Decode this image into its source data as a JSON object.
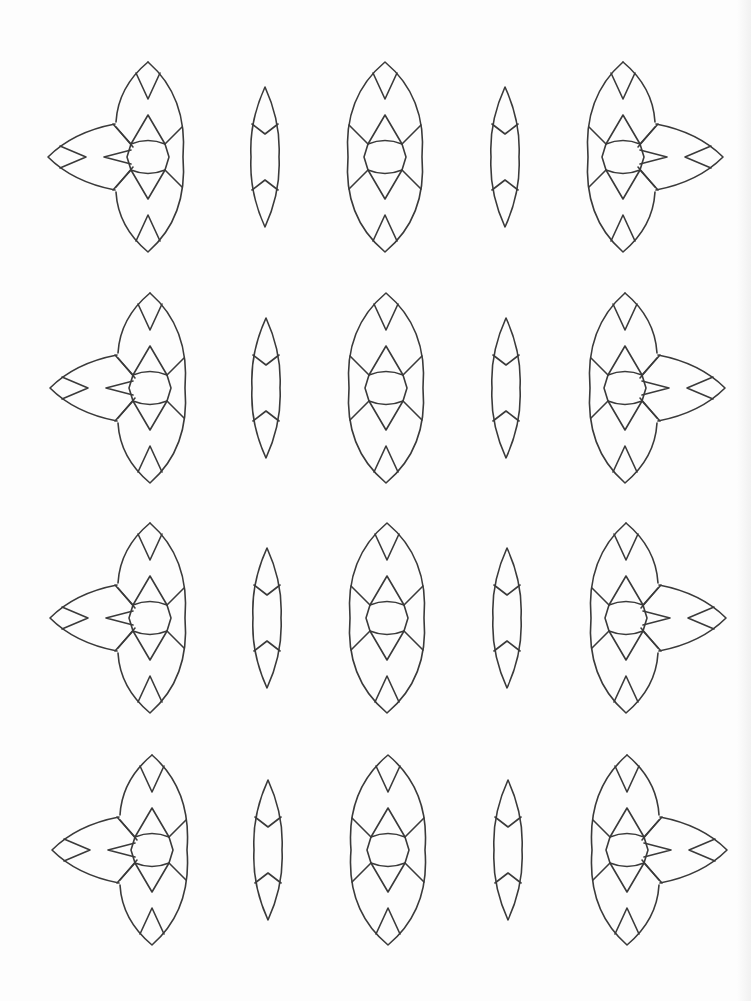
{
  "page": {
    "type": "coloring-page",
    "background": "#fdfdfd",
    "line_color": "#3a3a3a"
  },
  "pattern": {
    "rows": 4,
    "row_centers_y": [
      157,
      388,
      618,
      850
    ],
    "columns": [
      {
        "kind": "flower-left",
        "x": 148
      },
      {
        "kind": "lens",
        "x": 265
      },
      {
        "kind": "eye",
        "x": 385
      },
      {
        "kind": "lens",
        "x": 505
      },
      {
        "kind": "flower-right",
        "x": 623
      }
    ]
  }
}
